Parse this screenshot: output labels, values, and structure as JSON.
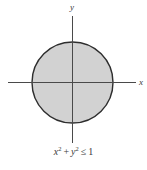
{
  "figure": {
    "axis_labels": {
      "y": "y",
      "x": "x"
    },
    "formula": {
      "term1_base": "x",
      "term1_exp": "2",
      "operator": "+",
      "term2_base": "y",
      "term2_exp": "2",
      "relation": "≤",
      "rhs": "1"
    },
    "colors": {
      "background": "#ffffff",
      "disk_fill": "#d2d2d2",
      "disk_stroke": "#2e2e2e",
      "axis": "#4a4a4a",
      "text": "#3a3a3a"
    }
  }
}
